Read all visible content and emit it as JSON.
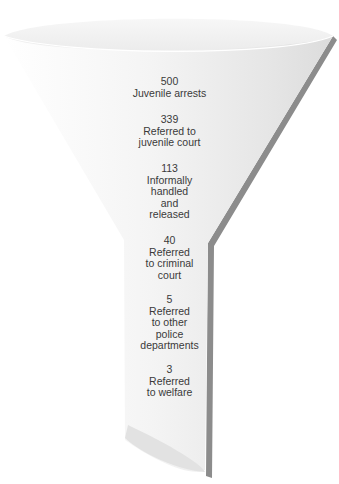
{
  "diagram": {
    "type": "funnel",
    "stages": [
      {
        "count": "500",
        "lines": [
          "Juvenile arrests"
        ]
      },
      {
        "count": "339",
        "lines": [
          "Referred to",
          "juvenile court"
        ]
      },
      {
        "count": "113",
        "lines": [
          "Informally",
          "handled",
          "and",
          "released"
        ]
      },
      {
        "count": "40",
        "lines": [
          "Referred",
          "to criminal",
          "court"
        ]
      },
      {
        "count": "5",
        "lines": [
          "Referred",
          "to other",
          "police",
          "departments"
        ]
      },
      {
        "count": "3",
        "lines": [
          "Referred",
          "to welfare"
        ]
      }
    ],
    "colors": {
      "funnel_fill": "#f0f0f0",
      "funnel_edge_shadow": "#8c8c8c",
      "text": "#3a3a3a"
    }
  }
}
